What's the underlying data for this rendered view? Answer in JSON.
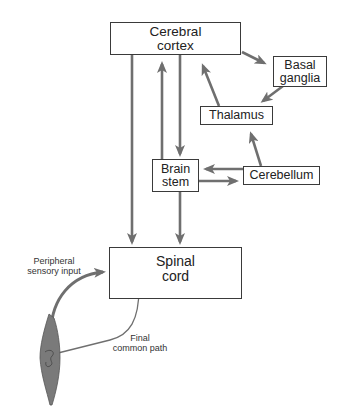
{
  "diagram": {
    "nodes": {
      "cerebral_cortex": {
        "line1": "Cerebral",
        "line2": "cortex"
      },
      "basal_ganglia": {
        "line1": "Basal",
        "line2": "ganglia"
      },
      "thalamus": {
        "label": "Thalamus"
      },
      "brain_stem": {
        "line1": "Brain",
        "line2": "stem"
      },
      "cerebellum": {
        "label": "Cerebellum"
      },
      "spinal_cord": {
        "line1": "Spinal",
        "line2": "cord"
      }
    },
    "annotations": {
      "peripheral": {
        "line1": "Peripheral",
        "line2": "sensory input"
      },
      "final_path": {
        "line1": "Final",
        "line2": "common path"
      }
    },
    "edges": [
      {
        "from": "Cerebral cortex",
        "to": "Basal ganglia"
      },
      {
        "from": "Basal ganglia",
        "to": "Thalamus"
      },
      {
        "from": "Thalamus",
        "to": "Cerebral cortex"
      },
      {
        "from": "Cerebellum",
        "to": "Thalamus"
      },
      {
        "from": "Cerebral cortex",
        "to": "Brain stem"
      },
      {
        "from": "Brain stem",
        "to": "Cerebral cortex"
      },
      {
        "from": "Cerebellum",
        "to": "Brain stem"
      },
      {
        "from": "Brain stem",
        "to": "Cerebellum"
      },
      {
        "from": "Cerebral cortex",
        "to": "Spinal cord"
      },
      {
        "from": "Brain stem",
        "to": "Spinal cord"
      },
      {
        "from": "Muscle",
        "to": "Spinal cord",
        "label": "Peripheral sensory input"
      },
      {
        "from": "Spinal cord",
        "to": "Muscle",
        "label": "Final common path"
      }
    ],
    "colors": {
      "arrow": "#6f6f6f",
      "border": "#3a3a3a",
      "muscle": "#7a7a7a",
      "neuron": "#c9c9c9"
    }
  }
}
